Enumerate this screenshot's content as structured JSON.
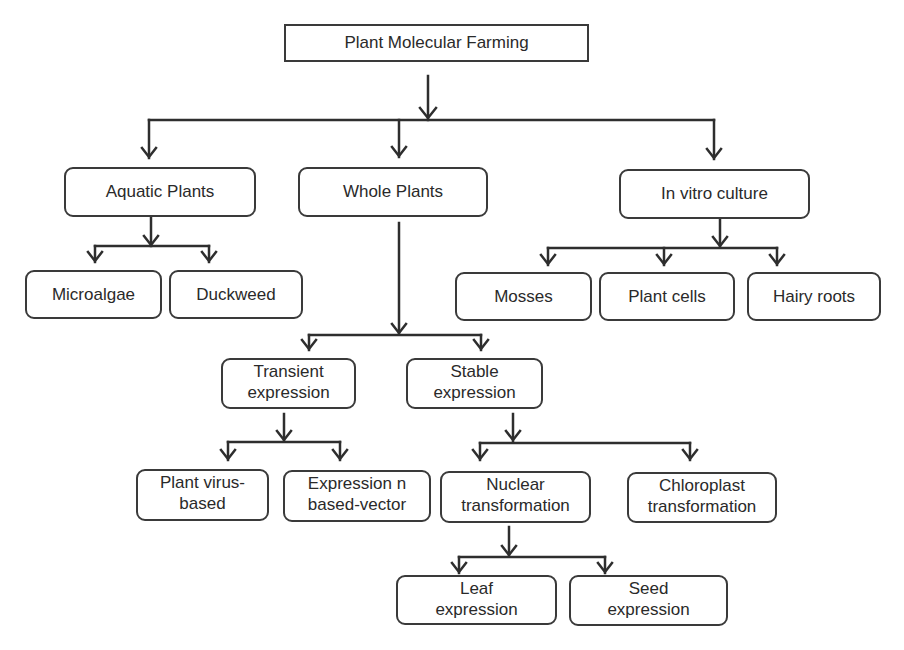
{
  "diagram": {
    "type": "hierarchy-flowchart",
    "root": {
      "label": "Plant Molecular Farming"
    },
    "level1": [
      {
        "id": "aquatic",
        "label": "Aquatic Plants"
      },
      {
        "id": "whole",
        "label": "Whole Plants"
      },
      {
        "id": "invitro",
        "label": "In vitro culture"
      }
    ],
    "aquatic_children": [
      {
        "id": "microalgae",
        "label": "Microalgae"
      },
      {
        "id": "duckweed",
        "label": "Duckweed"
      }
    ],
    "invitro_children": [
      {
        "id": "mosses",
        "label": "Mosses"
      },
      {
        "id": "plantcells",
        "label": "Plant cells"
      },
      {
        "id": "hairyroots",
        "label": "Hairy roots"
      }
    ],
    "whole_children": [
      {
        "id": "transient",
        "label": "Transient\nexpression"
      },
      {
        "id": "stable",
        "label": "Stable\nexpression"
      }
    ],
    "transient_children": [
      {
        "id": "virus",
        "label": "Plant virus-\nbased"
      },
      {
        "id": "vector",
        "label": "Expression n\nbased-vector"
      }
    ],
    "stable_children": [
      {
        "id": "nuclear",
        "label": "Nuclear\ntransformation"
      },
      {
        "id": "chloroplast",
        "label": "Chloroplast\ntransformation"
      }
    ],
    "nuclear_children": [
      {
        "id": "leaf",
        "label": "Leaf\nexpression"
      },
      {
        "id": "seed",
        "label": "Seed\nexpression"
      }
    ],
    "colors": {
      "stroke": "#3a3a3a",
      "text": "#2a2a2a",
      "background": "#ffffff"
    }
  }
}
